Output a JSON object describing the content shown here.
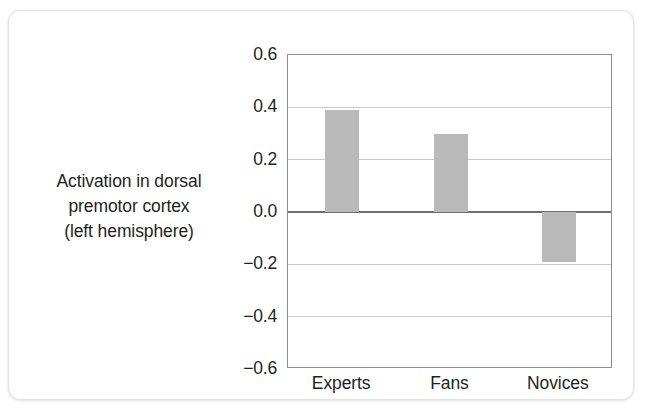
{
  "chart_data": {
    "type": "bar",
    "title": "",
    "xlabel": "",
    "ylabel": "Activation in dorsal premotor cortex (left hemisphere)",
    "ylabel_lines": [
      "Activation in dorsal",
      "premotor cortex",
      "(left hemisphere)"
    ],
    "categories": [
      "Experts",
      "Fans",
      "Novices"
    ],
    "values": [
      0.39,
      0.3,
      -0.19
    ],
    "ylim": [
      -0.6,
      0.6
    ],
    "yticks": [
      0.6,
      0.4,
      0.2,
      0.0,
      -0.2,
      -0.4,
      -0.6
    ],
    "ytick_labels": [
      "0.6",
      "0.4",
      "0.2",
      "0.0",
      "−0.2",
      "−0.4",
      "−0.6"
    ],
    "grid": true,
    "legend": "none",
    "bar_color": "#b9b9b9",
    "zero_line_color": "#6f6f6f",
    "gridline_color": "#c9c9c9",
    "frame_color": "#8d8d8d",
    "text_color": "#231f20"
  },
  "attribution": {
    "lines": [
      "From Beilock et al. (2008). © 2008 National",
      "Academy of Sciences"
    ],
    "color": "#6d6d6d"
  }
}
